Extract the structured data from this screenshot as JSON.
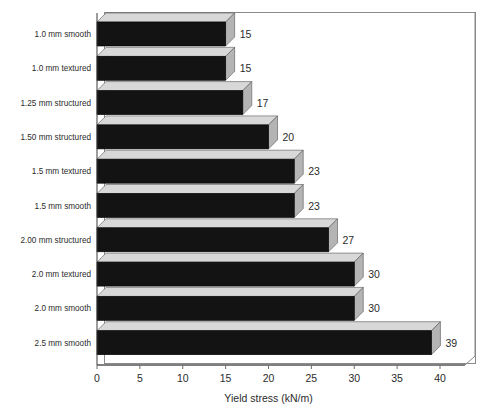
{
  "chart_data": {
    "type": "bar",
    "orientation": "horizontal",
    "style": "3d",
    "title": "",
    "xlabel": "Yield stress (kN/m)",
    "ylabel": "",
    "xlim": [
      0,
      40
    ],
    "xticks": [
      0,
      5,
      10,
      15,
      20,
      25,
      30,
      35,
      40
    ],
    "grid": false,
    "legend": null,
    "categories": [
      "1.0 mm smooth",
      "1.0 mm textured",
      "1.25 mm structured",
      "1.50 mm structured",
      "1.5 mm textured",
      "1.5 mm smooth",
      "2.00 mm structured",
      "2.0 mm textured",
      "2.0 mm smooth",
      "2.5 mm smooth"
    ],
    "values": [
      15,
      15,
      17,
      20,
      23,
      23,
      27,
      30,
      30,
      39
    ],
    "data_labels": [
      "15",
      "15",
      "17",
      "20",
      "23",
      "23",
      "27",
      "30",
      "30",
      "39"
    ],
    "colors": {
      "bar_front": "#131313",
      "bar_top": "#d8d8d8",
      "bar_side": "#b4b4b4",
      "axis": "#3a3a3a",
      "frame": "#8a8a8a",
      "text": "#2b2b2b",
      "background": "#ffffff"
    }
  },
  "axis": {
    "x_title": "Yield stress (kN/m)",
    "tick_labels": [
      "0",
      "5",
      "10",
      "15",
      "20",
      "25",
      "30",
      "35",
      "40"
    ]
  }
}
